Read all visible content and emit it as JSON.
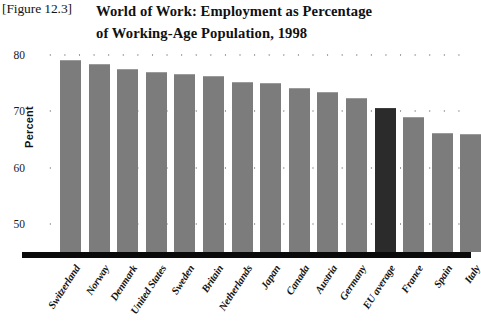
{
  "figure": {
    "number_label": "[Figure 12.3]",
    "title_line1": "World of Work: Employment as Percentage",
    "title_line2": "of Working-Age Population, 1998"
  },
  "chart_data": {
    "type": "bar",
    "title": "World of Work: Employment as Percentage of Working-Age Population, 1998",
    "xlabel": "",
    "ylabel": "Percent",
    "ylim": [
      45,
      80
    ],
    "yticks": [
      50,
      60,
      70,
      80
    ],
    "ytick_labels": [
      "50",
      "60",
      "70",
      "80"
    ],
    "grid": "dotted-horizontal",
    "legend": "none",
    "bar_color": "#7c7c7c",
    "highlight_color": "#2b2b2b",
    "highlight_category": "EU average",
    "categories": [
      "Switzerland",
      "Norway",
      "Denmark",
      "United States",
      "Sweden",
      "Britain",
      "Netherlands",
      "Japan",
      "Canada",
      "Austria",
      "Germany",
      "EU average",
      "France",
      "Spain",
      "Italy"
    ],
    "values": [
      79.2,
      78.4,
      77.6,
      77.0,
      76.6,
      76.2,
      75.2,
      75.0,
      74.2,
      73.4,
      72.4,
      70.6,
      69.0,
      66.2,
      66.0
    ]
  }
}
